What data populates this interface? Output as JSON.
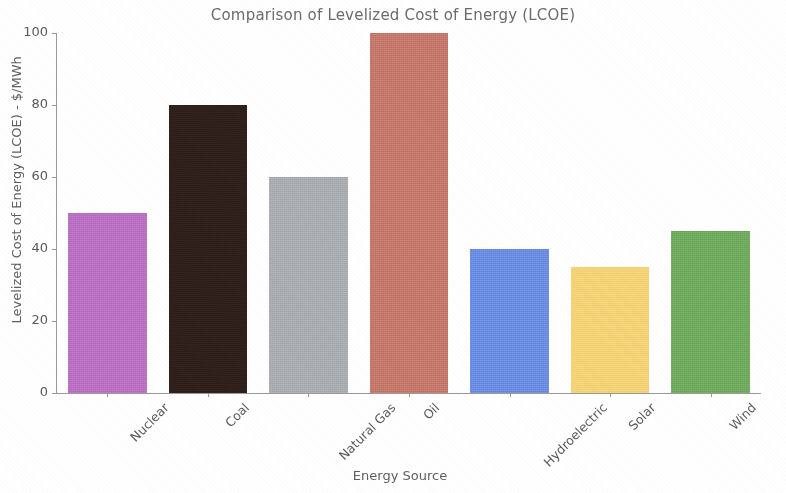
{
  "chart_data": {
    "type": "bar",
    "title": "Comparison of Levelized Cost of Energy (LCOE)",
    "xlabel": "Energy Source",
    "ylabel": "Levelized Cost of Energy (LCOE) - $/MWh",
    "categories": [
      "Nuclear",
      "Coal",
      "Natural Gas",
      "Oil",
      "Hydroelectric",
      "Solar",
      "Wind"
    ],
    "values": [
      50,
      80,
      60,
      100,
      40,
      35,
      45
    ],
    "colors": [
      "#ba70c4",
      "#2e1f1b",
      "#a9adb2",
      "#c5786b",
      "#6b8ce4",
      "#f6d375",
      "#6fab5e"
    ],
    "ylim": [
      0,
      100
    ],
    "yticks": [
      0,
      20,
      40,
      60,
      80,
      100
    ],
    "ytick_labels": [
      "0",
      "20",
      "40",
      "60",
      "80",
      "100"
    ],
    "grid": false,
    "legend": "none",
    "title_color": "#6c6c6c",
    "axis_color": "#5a5a5a"
  }
}
